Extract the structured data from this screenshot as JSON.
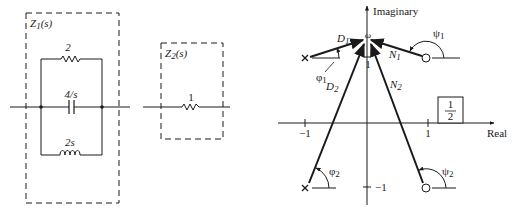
{
  "circuit": {
    "z1": {
      "label": "Z",
      "sub": "1",
      "arg": "(s)",
      "resistor": "2",
      "capacitor": "4/s",
      "inductor": "2s"
    },
    "z2": {
      "label": "Z",
      "sub": "2",
      "arg": "(s)",
      "resistor": "1"
    }
  },
  "plot": {
    "y_axis_label": "Imaginary",
    "x_axis_label": "Real",
    "omega_label": "ω",
    "ticks": {
      "x_neg": "−1",
      "x_pos": "1",
      "y_pos": "1",
      "y_neg": "−1"
    },
    "vectors": {
      "d1": "D",
      "d1_sub": "1",
      "d2": "D",
      "d2_sub": "2",
      "n1": "N",
      "n1_sub": "1",
      "n2": "N",
      "n2_sub": "2"
    },
    "angles": {
      "phi1": "φ",
      "phi1_sub": "1",
      "phi2": "φ",
      "phi2_sub": "2",
      "psi1": "ψ",
      "psi1_sub": "1",
      "psi2": "ψ",
      "psi2_sub": "2"
    },
    "gain_box": {
      "numerator": "1",
      "denominator": "2"
    }
  }
}
